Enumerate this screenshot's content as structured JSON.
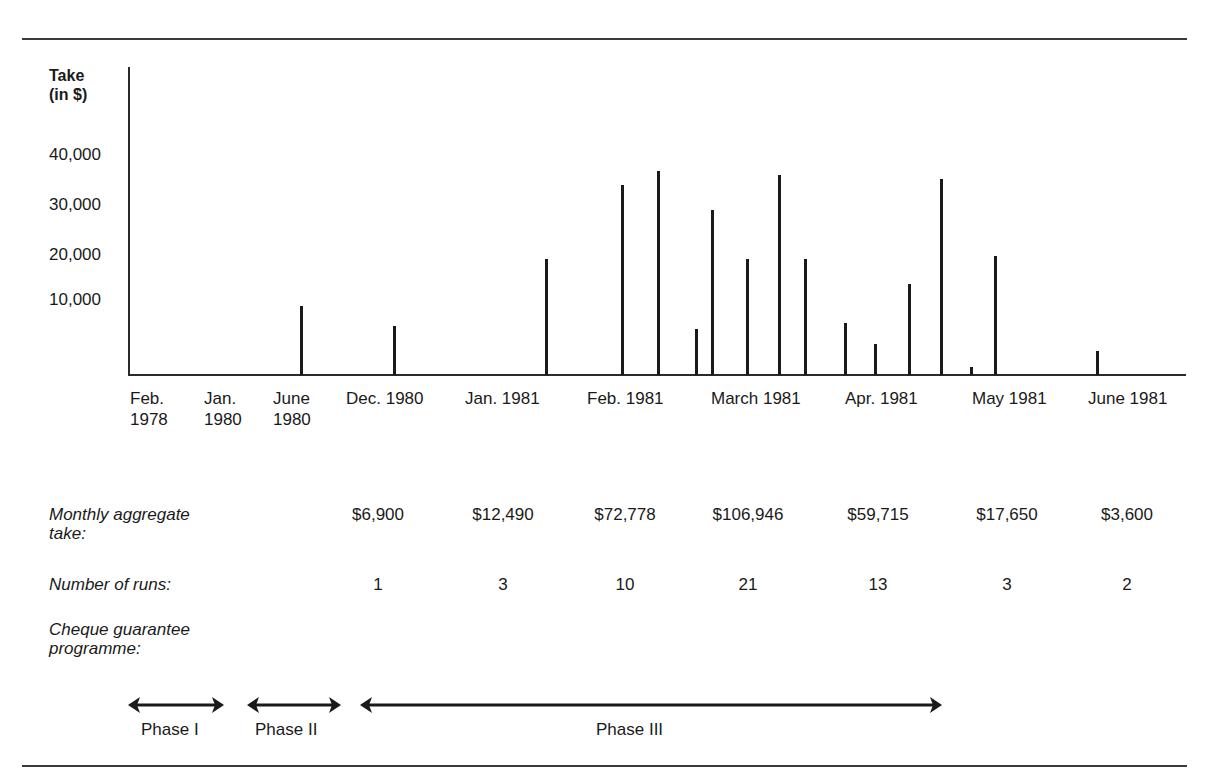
{
  "chart_data": {
    "type": "bar",
    "title": "",
    "ylabel": "Take (in $)",
    "xlabel": "",
    "ylim": [
      0,
      45000
    ],
    "yticks": [
      "40,000",
      "30,000",
      "20,000",
      "10,000"
    ],
    "x_tick_labels": [
      "Feb. 1978",
      "Jan. 1980",
      "June 1980",
      "Dec. 1980",
      "Jan. 1981",
      "Feb. 1981",
      "March 1981",
      "Apr. 1981",
      "May 1981",
      "June 1981"
    ],
    "grid": false,
    "legend": null,
    "runs": [
      {
        "period": "June 1980",
        "value": 9000
      },
      {
        "period": "Dec. 1980",
        "value": 6000
      },
      {
        "period": "Jan. 1981",
        "value": 19500
      },
      {
        "period": "Feb. 1981",
        "value": 34000
      },
      {
        "period": "Feb. 1981",
        "value": 37000
      },
      {
        "period": "Feb. 1981",
        "value": 5500
      },
      {
        "period": "March 1981",
        "value": 29000
      },
      {
        "period": "March 1981",
        "value": 19500
      },
      {
        "period": "March 1981",
        "value": 36000
      },
      {
        "period": "March 1981",
        "value": 19500
      },
      {
        "period": "Apr. 1981",
        "value": 6000
      },
      {
        "period": "Apr. 1981",
        "value": 3000
      },
      {
        "period": "Apr. 1981",
        "value": 14000
      },
      {
        "period": "Apr. 1981",
        "value": 35000
      },
      {
        "period": "May 1981",
        "value": 1000
      },
      {
        "period": "May 1981",
        "value": 20000
      },
      {
        "period": "June 1981",
        "value": 2500
      }
    ],
    "table": {
      "columns": [
        "Dec. 1980",
        "Jan. 1981",
        "Feb. 1981",
        "March 1981",
        "Apr. 1981",
        "May 1981",
        "June 1981"
      ],
      "monthly_aggregate_take": [
        "$6,900",
        "$12,490",
        "$72,778",
        "$106,946",
        "$59,715",
        "$17,650",
        "$3,600"
      ],
      "number_of_runs": [
        1,
        3,
        10,
        21,
        13,
        3,
        2
      ]
    },
    "phases": [
      {
        "name": "Phase I",
        "from": "Feb. 1978",
        "to": "Jan. 1980"
      },
      {
        "name": "Phase II",
        "from": "Jan. 1980",
        "to": "June 1980"
      },
      {
        "name": "Phase III",
        "from": "Dec. 1980",
        "to": "Apr. 1981"
      }
    ]
  },
  "axis": {
    "ylabel_line1": "Take",
    "ylabel_line2": "(in $)",
    "yticks": [
      {
        "label": "40,000",
        "top": 145
      },
      {
        "label": "30,000",
        "top": 195
      },
      {
        "label": "20,000",
        "top": 245
      },
      {
        "label": "10,000",
        "top": 290
      }
    ]
  },
  "bars": [
    {
      "x": 300,
      "top": 306
    },
    {
      "x": 393,
      "top": 326
    },
    {
      "x": 545,
      "top": 259
    },
    {
      "x": 621,
      "top": 185
    },
    {
      "x": 657,
      "top": 171
    },
    {
      "x": 695,
      "top": 329
    },
    {
      "x": 711,
      "top": 210
    },
    {
      "x": 746,
      "top": 259
    },
    {
      "x": 778,
      "top": 175
    },
    {
      "x": 804,
      "top": 259
    },
    {
      "x": 844,
      "top": 323
    },
    {
      "x": 874,
      "top": 344
    },
    {
      "x": 908,
      "top": 284
    },
    {
      "x": 940,
      "top": 179
    },
    {
      "x": 970,
      "top": 367
    },
    {
      "x": 994,
      "top": 256
    },
    {
      "x": 1096,
      "top": 351
    }
  ],
  "xticks": [
    {
      "line1": "Feb.",
      "line2": "1978",
      "left": 130
    },
    {
      "line1": "Jan.",
      "line2": "1980",
      "left": 204
    },
    {
      "line1": "June",
      "line2": "1980",
      "left": 273
    },
    {
      "line1": "Dec. 1980",
      "line2": "",
      "left": 346
    },
    {
      "line1": "Jan. 1981",
      "line2": "",
      "left": 465
    },
    {
      "line1": "Feb. 1981",
      "line2": "",
      "left": 587
    },
    {
      "line1": "March 1981",
      "line2": "",
      "left": 711
    },
    {
      "line1": "Apr. 1981",
      "line2": "",
      "left": 845
    },
    {
      "line1": "May 1981",
      "line2": "",
      "left": 972
    },
    {
      "line1": "June 1981",
      "line2": "",
      "left": 1088
    }
  ],
  "rows": {
    "aggregate_label_1": "Monthly aggregate",
    "aggregate_label_2": "take:",
    "runs_label": "Number of runs:",
    "cheque_label_1": "Cheque guarantee",
    "cheque_label_2": "programme:",
    "aggregate_values": [
      {
        "text": "$6,900",
        "center": 378
      },
      {
        "text": "$12,490",
        "center": 503
      },
      {
        "text": "$72,778",
        "center": 625
      },
      {
        "text": "$106,946",
        "center": 748
      },
      {
        "text": "$59,715",
        "center": 878
      },
      {
        "text": "$17,650",
        "center": 1007
      },
      {
        "text": "$3,600",
        "center": 1127
      }
    ],
    "runs_values": [
      {
        "text": "1",
        "center": 378
      },
      {
        "text": "3",
        "center": 503
      },
      {
        "text": "10",
        "center": 625
      },
      {
        "text": "21",
        "center": 748
      },
      {
        "text": "13",
        "center": 878
      },
      {
        "text": "3",
        "center": 1007
      },
      {
        "text": "2",
        "center": 1127
      }
    ]
  },
  "phases": [
    {
      "label": "Phase I",
      "x1": 128,
      "x2": 224,
      "label_left": 141
    },
    {
      "label": "Phase II",
      "x1": 247,
      "x2": 341,
      "label_left": 255
    },
    {
      "label": "Phase III",
      "x1": 360,
      "x2": 942,
      "label_left": 596
    }
  ]
}
